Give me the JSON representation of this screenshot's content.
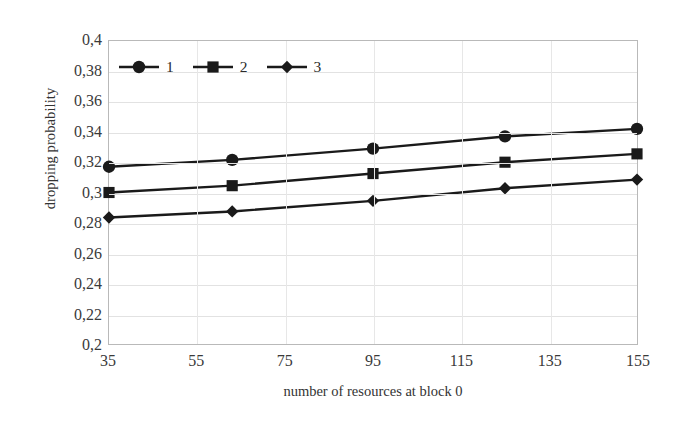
{
  "chart_data": {
    "type": "line",
    "title": "",
    "xlabel": "number of resources at block 0",
    "ylabel": "dropping probability",
    "x": [
      35,
      63,
      95,
      125,
      155
    ],
    "xlim": [
      35,
      155
    ],
    "ylim": [
      0.2,
      0.4
    ],
    "xticks": [
      "35",
      "55",
      "75",
      "95",
      "115",
      "135",
      "155"
    ],
    "xtick_values": [
      35,
      55,
      75,
      95,
      115,
      135,
      155
    ],
    "yticks": [
      "0,2",
      "0,22",
      "0,24",
      "0,26",
      "0,28",
      "0,3",
      "0,32",
      "0,34",
      "0,36",
      "0,38",
      "0,4"
    ],
    "ytick_values": [
      0.2,
      0.22,
      0.24,
      0.26,
      0.28,
      0.3,
      0.32,
      0.34,
      0.36,
      0.38,
      0.4
    ],
    "grid": true,
    "legend_position": "top-left",
    "series": [
      {
        "name": "1",
        "marker": "circle",
        "color": "#1a1a1a",
        "values": [
          0.317,
          0.3215,
          0.329,
          0.337,
          0.342
        ]
      },
      {
        "name": "2",
        "marker": "square",
        "color": "#1a1a1a",
        "values": [
          0.3,
          0.3045,
          0.3125,
          0.32,
          0.3255
        ]
      },
      {
        "name": "3",
        "marker": "diamond",
        "color": "#1a1a1a",
        "values": [
          0.2835,
          0.2875,
          0.2945,
          0.3028,
          0.3085
        ]
      }
    ]
  },
  "legend": {
    "entries": [
      {
        "label": "1"
      },
      {
        "label": "2"
      },
      {
        "label": "3"
      }
    ]
  },
  "axes": {
    "y_title": "dropping probability",
    "x_title": "number of resources at block 0"
  },
  "colors": {
    "line": "#1a1a1a",
    "grid": "#e2e2e2",
    "frame": "#b9b9b9",
    "text": "#2b2b2b"
  }
}
